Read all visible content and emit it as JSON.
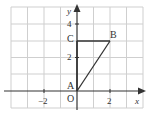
{
  "diagram": {
    "type": "coordinate-grid",
    "axes": {
      "x_label": "x",
      "y_label": "y",
      "x_ticks": [
        {
          "value": -2,
          "label": "−2"
        },
        {
          "value": 2,
          "label": "2"
        }
      ],
      "y_ticks": [
        {
          "value": 2,
          "label": "2"
        },
        {
          "value": 4,
          "label": "4"
        }
      ],
      "x_range": [
        -4,
        4
      ],
      "y_range": [
        -1,
        5
      ]
    },
    "points": {
      "O": {
        "label": "O",
        "x": 0,
        "y": 0
      },
      "A": {
        "label": "A",
        "x": 0,
        "y": 0
      },
      "B": {
        "label": "B",
        "x": 2,
        "y": 3
      },
      "C": {
        "label": "C",
        "x": 0,
        "y": 3
      }
    },
    "segments": [
      "C-B",
      "A-B",
      "A-C"
    ],
    "colors": {
      "grid": "#cfcfcf",
      "axis": "#333333",
      "shape": "#333333"
    }
  }
}
